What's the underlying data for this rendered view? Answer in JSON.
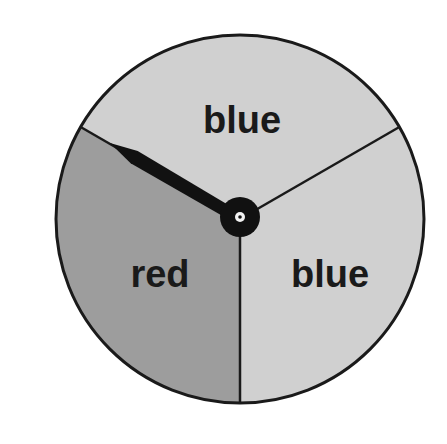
{
  "spinner": {
    "center": [
      240,
      219
    ],
    "radius": 184,
    "colors": {
      "background": "#ffffff",
      "outline": "#1a1a1a",
      "red_sector": "#9d9d9d",
      "blue_sector": "#d0d0d0",
      "needle": "#111111",
      "pivot": "#f2f2f2"
    },
    "sectors": [
      {
        "name": "top",
        "label": "blue",
        "color_key": "blue_sector",
        "start_deg": -150,
        "end_deg": -30,
        "label_pos": [
          242,
          133
        ]
      },
      {
        "name": "right",
        "label": "blue",
        "color_key": "blue_sector",
        "start_deg": -30,
        "end_deg": 90,
        "label_pos": [
          330,
          287
        ]
      },
      {
        "name": "left",
        "label": "red",
        "color_key": "red_sector",
        "start_deg": 90,
        "end_deg": 210,
        "label_pos": [
          160,
          287
        ]
      }
    ],
    "needle": {
      "tip": [
        110,
        143
      ],
      "points_to": "red"
    }
  }
}
